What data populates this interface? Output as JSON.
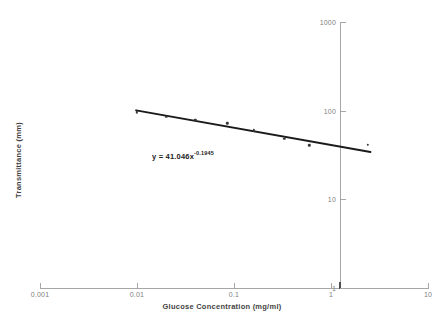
{
  "chart_data": {
    "type": "scatter",
    "title": "",
    "xlabel": "Glucose Concentration (mg/ml)",
    "ylabel": "Transmittance (mm)",
    "xscale": "log",
    "yscale": "log",
    "xlim": [
      0.001,
      10
    ],
    "ylim": [
      1,
      1000
    ],
    "grid": false,
    "legend": false,
    "x_tick_labels": [
      "0.001",
      "0.01",
      "0.1",
      "1",
      "10"
    ],
    "x_ticks": [
      0.001,
      0.01,
      0.1,
      1,
      10
    ],
    "y_tick_labels": [
      "1000",
      "100",
      "10",
      "1"
    ],
    "y_ticks": [
      1000,
      100,
      10,
      1
    ],
    "series": [
      {
        "name": "Transmittance vs Glucose Concentration",
        "marker": "dot",
        "color": "#3a3a3a",
        "x": [
          0.01,
          0.02,
          0.04,
          0.085,
          0.16,
          0.33,
          0.6,
          2.4
        ],
        "y": [
          96.0,
          85.0,
          79.0,
          72.0,
          60.0,
          48.0,
          40.5,
          41.5
        ]
      }
    ],
    "trendline": {
      "type": "power",
      "equation_text": "y = 41.046x",
      "exponent_text": "-0.1945",
      "coefficient": 41.046,
      "exponent": -0.1945,
      "color": "#1a1a1a",
      "x_start": 0.0098,
      "x_end": 2.55
    }
  }
}
